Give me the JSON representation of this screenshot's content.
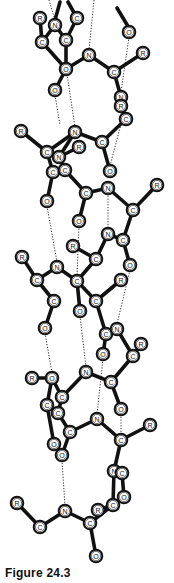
{
  "figure": {
    "caption": "Figure 24.3",
    "colors": {
      "bond": "#111111",
      "atom_fill": "#ffffff",
      "atom_stroke": "#111111",
      "hbond": "#333333",
      "background": "#ffffff"
    }
  },
  "atoms": [
    {
      "id": "a1",
      "label": "R",
      "x": 40,
      "y": 18
    },
    {
      "id": "a2",
      "label": "N",
      "x": 55,
      "y": 25
    },
    {
      "id": "a3",
      "label": "C",
      "x": 77,
      "y": 18
    },
    {
      "id": "a4",
      "label": "C",
      "x": 42,
      "y": 42
    },
    {
      "id": "a5",
      "label": "C",
      "x": 66,
      "y": 40
    },
    {
      "id": "a6",
      "label": "O",
      "x": 66,
      "y": 69
    },
    {
      "id": "a7",
      "label": "O",
      "x": 55,
      "y": 90
    },
    {
      "id": "a8",
      "label": "N",
      "x": 89,
      "y": 55
    },
    {
      "id": "a9",
      "label": "C",
      "x": 114,
      "y": 72
    },
    {
      "id": "a10",
      "label": "R",
      "x": 143,
      "y": 53
    },
    {
      "id": "a11",
      "label": "O",
      "x": 129,
      "y": 32
    },
    {
      "id": "a12",
      "label": "N",
      "x": 121,
      "y": 97
    },
    {
      "id": "a13",
      "label": "R",
      "x": 121,
      "y": 106
    },
    {
      "id": "a14",
      "label": "C",
      "x": 126,
      "y": 119
    },
    {
      "id": "a15",
      "label": "R",
      "x": 21,
      "y": 131
    },
    {
      "id": "a16",
      "label": "N",
      "x": 75,
      "y": 132
    },
    {
      "id": "a17",
      "label": "R",
      "x": 79,
      "y": 147
    },
    {
      "id": "a18",
      "label": "C",
      "x": 102,
      "y": 142
    },
    {
      "id": "a19",
      "label": "C",
      "x": 47,
      "y": 152
    },
    {
      "id": "a20",
      "label": "N",
      "x": 59,
      "y": 157
    },
    {
      "id": "a21",
      "label": "C",
      "x": 53,
      "y": 172
    },
    {
      "id": "a22",
      "label": "C",
      "x": 65,
      "y": 170
    },
    {
      "id": "a23",
      "label": "O",
      "x": 110,
      "y": 171
    },
    {
      "id": "a24",
      "label": "O",
      "x": 47,
      "y": 201
    },
    {
      "id": "a25",
      "label": "C",
      "x": 86,
      "y": 193
    },
    {
      "id": "a26",
      "label": "N",
      "x": 108,
      "y": 188
    },
    {
      "id": "a27",
      "label": "R",
      "x": 157,
      "y": 185
    },
    {
      "id": "a28",
      "label": "C",
      "x": 133,
      "y": 210
    },
    {
      "id": "a29",
      "label": "O",
      "x": 79,
      "y": 221
    },
    {
      "id": "a30",
      "label": "N",
      "x": 108,
      "y": 234
    },
    {
      "id": "a31",
      "label": "C",
      "x": 123,
      "y": 240
    },
    {
      "id": "a32",
      "label": "R",
      "x": 73,
      "y": 246
    },
    {
      "id": "a33",
      "label": "C",
      "x": 96,
      "y": 259
    },
    {
      "id": "a34",
      "label": "O",
      "x": 130,
      "y": 265
    },
    {
      "id": "a35",
      "label": "R",
      "x": 22,
      "y": 257
    },
    {
      "id": "a36",
      "label": "N",
      "x": 57,
      "y": 267
    },
    {
      "id": "a37",
      "label": "C",
      "x": 37,
      "y": 280
    },
    {
      "id": "a38",
      "label": "C",
      "x": 77,
      "y": 281
    },
    {
      "id": "a39",
      "label": "R",
      "x": 121,
      "y": 280
    },
    {
      "id": "a40",
      "label": "C",
      "x": 54,
      "y": 301
    },
    {
      "id": "a41",
      "label": "O",
      "x": 80,
      "y": 311
    },
    {
      "id": "a42",
      "label": "C",
      "x": 96,
      "y": 301
    },
    {
      "id": "a43",
      "label": "O",
      "x": 45,
      "y": 328
    },
    {
      "id": "a44",
      "label": "C",
      "x": 106,
      "y": 334
    },
    {
      "id": "a45",
      "label": "N",
      "x": 117,
      "y": 329
    },
    {
      "id": "a46",
      "label": "R",
      "x": 141,
      "y": 344
    },
    {
      "id": "a47",
      "label": "C",
      "x": 133,
      "y": 356
    },
    {
      "id": "a48",
      "label": "O",
      "x": 103,
      "y": 354
    },
    {
      "id": "a49",
      "label": "N",
      "x": 86,
      "y": 372
    },
    {
      "id": "a50",
      "label": "R",
      "x": 32,
      "y": 378
    },
    {
      "id": "a51",
      "label": "O",
      "x": 52,
      "y": 378
    },
    {
      "id": "a52",
      "label": "C",
      "x": 111,
      "y": 382
    },
    {
      "id": "a53",
      "label": "C",
      "x": 62,
      "y": 397
    },
    {
      "id": "a54",
      "label": "C",
      "x": 47,
      "y": 405
    },
    {
      "id": "a55",
      "label": "C",
      "x": 58,
      "y": 413
    },
    {
      "id": "a56",
      "label": "O",
      "x": 121,
      "y": 409
    },
    {
      "id": "a57",
      "label": "N",
      "x": 97,
      "y": 419
    },
    {
      "id": "a58",
      "label": "R",
      "x": 150,
      "y": 425
    },
    {
      "id": "a59",
      "label": "C",
      "x": 70,
      "y": 432
    },
    {
      "id": "a60",
      "label": "C",
      "x": 121,
      "y": 440
    },
    {
      "id": "a61",
      "label": "O",
      "x": 54,
      "y": 444
    },
    {
      "id": "a62",
      "label": "O",
      "x": 62,
      "y": 455
    },
    {
      "id": "a63",
      "label": "N",
      "x": 114,
      "y": 471
    },
    {
      "id": "a64",
      "label": "C",
      "x": 122,
      "y": 473
    },
    {
      "id": "a65",
      "label": "O",
      "x": 124,
      "y": 497
    },
    {
      "id": "a66",
      "label": "R",
      "x": 98,
      "y": 510
    },
    {
      "id": "a67",
      "label": "C",
      "x": 113,
      "y": 505
    },
    {
      "id": "a68",
      "label": "R",
      "x": 17,
      "y": 503
    },
    {
      "id": "a69",
      "label": "C",
      "x": 40,
      "y": 527
    },
    {
      "id": "a70",
      "label": "N",
      "x": 65,
      "y": 511
    },
    {
      "id": "a71",
      "label": "C",
      "x": 90,
      "y": 523
    },
    {
      "id": "a72",
      "label": "O",
      "x": 96,
      "y": 556
    }
  ],
  "bonds": [
    [
      "a1",
      "a4"
    ],
    [
      "a2",
      "a4"
    ],
    [
      "a2",
      "a5"
    ],
    [
      "a3",
      "a5"
    ],
    [
      "a4",
      "a6"
    ],
    [
      "a5",
      "a6"
    ],
    [
      "a6",
      "a7"
    ],
    [
      "a6",
      "a8"
    ],
    [
      "a8",
      "a9"
    ],
    [
      "a9",
      "a10"
    ],
    [
      "a9",
      "a12"
    ],
    [
      "a12",
      "a13"
    ],
    [
      "a13",
      "a14"
    ],
    [
      "a14",
      "a18"
    ],
    [
      "a15",
      "a19"
    ],
    [
      "a19",
      "a16"
    ],
    [
      "a16",
      "a18"
    ],
    [
      "a16",
      "a20"
    ],
    [
      "a20",
      "a22"
    ],
    [
      "a19",
      "a21"
    ],
    [
      "a20",
      "a17"
    ],
    [
      "a18",
      "a23"
    ],
    [
      "a22",
      "a25"
    ],
    [
      "a21",
      "a24"
    ],
    [
      "a25",
      "a26"
    ],
    [
      "a25",
      "a29"
    ],
    [
      "a26",
      "a28"
    ],
    [
      "a28",
      "a27"
    ],
    [
      "a28",
      "a31"
    ],
    [
      "a31",
      "a30"
    ],
    [
      "a30",
      "a33"
    ],
    [
      "a33",
      "a32"
    ],
    [
      "a31",
      "a34"
    ],
    [
      "a33",
      "a38"
    ],
    [
      "a35",
      "a37"
    ],
    [
      "a37",
      "a36"
    ],
    [
      "a36",
      "a38"
    ],
    [
      "a37",
      "a40"
    ],
    [
      "a40",
      "a43"
    ],
    [
      "a38",
      "a41"
    ],
    [
      "a38",
      "a42"
    ],
    [
      "a42",
      "a39"
    ],
    [
      "a42",
      "a44"
    ],
    [
      "a44",
      "a45"
    ],
    [
      "a45",
      "a47"
    ],
    [
      "a47",
      "a46"
    ],
    [
      "a47",
      "a52"
    ],
    [
      "a44",
      "a48"
    ],
    [
      "a52",
      "a49"
    ],
    [
      "a49",
      "a53"
    ],
    [
      "a52",
      "a56"
    ],
    [
      "a50",
      "a51"
    ],
    [
      "a51",
      "a53"
    ],
    [
      "a51",
      "a54"
    ],
    [
      "a53",
      "a55"
    ],
    [
      "a55",
      "a59"
    ],
    [
      "a59",
      "a57"
    ],
    [
      "a57",
      "a60"
    ],
    [
      "a60",
      "a58"
    ],
    [
      "a54",
      "a61"
    ],
    [
      "a59",
      "a62"
    ],
    [
      "a60",
      "a63"
    ],
    [
      "a63",
      "a64"
    ],
    [
      "a64",
      "a65"
    ],
    [
      "a63",
      "a67"
    ],
    [
      "a67",
      "a66"
    ],
    [
      "a68",
      "a69"
    ],
    [
      "a69",
      "a70"
    ],
    [
      "a70",
      "a71"
    ],
    [
      "a71",
      "a67"
    ],
    [
      "a71",
      "a72"
    ],
    [
      "a3",
      "a11_top"
    ]
  ],
  "extra_bonds": [
    {
      "from": [
        68,
        2
      ],
      "to": [
        77,
        18
      ]
    },
    {
      "from": [
        117,
        8
      ],
      "to": [
        129,
        28
      ]
    },
    {
      "from": [
        60,
        2
      ],
      "to": [
        55,
        20
      ]
    }
  ],
  "hbonds": [
    {
      "from": [
        49,
        0
      ],
      "to": [
        55,
        20
      ]
    },
    {
      "from": [
        94,
        0
      ],
      "to": [
        89,
        50
      ]
    },
    {
      "from": [
        129,
        37
      ],
      "to": [
        121,
        92
      ]
    },
    {
      "from": [
        55,
        95
      ],
      "to": [
        60,
        125
      ]
    },
    {
      "from": [
        67,
        74
      ],
      "to": [
        75,
        127
      ]
    },
    {
      "from": [
        110,
        166
      ],
      "to": [
        121,
        124
      ]
    },
    {
      "from": [
        47,
        206
      ],
      "to": [
        57,
        262
      ]
    },
    {
      "from": [
        108,
        193
      ],
      "to": [
        108,
        229
      ]
    },
    {
      "from": [
        79,
        226
      ],
      "to": [
        77,
        276
      ]
    },
    {
      "from": [
        130,
        270
      ],
      "to": [
        117,
        324
      ]
    },
    {
      "from": [
        45,
        333
      ],
      "to": [
        52,
        373
      ]
    },
    {
      "from": [
        80,
        316
      ],
      "to": [
        86,
        367
      ]
    },
    {
      "from": [
        103,
        359
      ],
      "to": [
        97,
        414
      ]
    },
    {
      "from": [
        121,
        414
      ],
      "to": [
        121,
        435
      ]
    },
    {
      "from": [
        62,
        460
      ],
      "to": [
        65,
        506
      ]
    },
    {
      "from": [
        121,
        445
      ],
      "to": [
        114,
        466
      ]
    }
  ]
}
